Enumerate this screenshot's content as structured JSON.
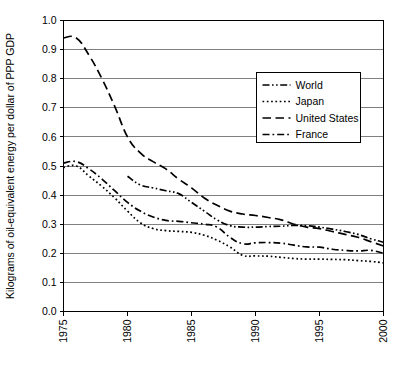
{
  "chart_data": {
    "type": "line",
    "title": "",
    "subtitle": "",
    "xlabel": "",
    "ylabel": "Kilograms of oil-equivalent energy per dollar of PPP GDP",
    "xlim": [
      1975,
      2000
    ],
    "ylim": [
      0.0,
      1.0
    ],
    "grid": true,
    "grid_axis": "y",
    "legend_position": "upper-right-inside",
    "x_tick_labels": [
      "1975",
      "1980",
      "1985",
      "1990",
      "1995",
      "2000"
    ],
    "x_ticks": [
      1975,
      1980,
      1985,
      1990,
      1995,
      2000
    ],
    "y_tick_labels": [
      "0.0",
      "0.1",
      "0.2",
      "0.3",
      "0.4",
      "0.5",
      "0.6",
      "0.7",
      "0.8",
      "0.9",
      "1.0"
    ],
    "y_ticks": [
      0.0,
      0.1,
      0.2,
      0.3,
      0.4,
      0.5,
      0.6,
      0.7,
      0.8,
      0.9,
      1.0
    ],
    "x": [
      1975,
      1976,
      1977,
      1978,
      1979,
      1980,
      1981,
      1982,
      1983,
      1984,
      1985,
      1986,
      1987,
      1988,
      1989,
      1990,
      1991,
      1992,
      1993,
      1994,
      1995,
      1996,
      1997,
      1998,
      1999,
      2000
    ],
    "series": [
      {
        "name": "World",
        "dash": "dash-dot-dot",
        "color": "#000000",
        "x": [
          1980,
          1981,
          1982,
          1983,
          1984,
          1985,
          1986,
          1987,
          1988,
          1989,
          1990,
          1991,
          1992,
          1993,
          1994,
          1995,
          1996,
          1997,
          1998,
          1999,
          2000
        ],
        "values": [
          0.465,
          0.435,
          0.425,
          0.415,
          0.405,
          0.375,
          0.345,
          0.315,
          0.295,
          0.29,
          0.29,
          0.292,
          0.293,
          0.296,
          0.295,
          0.29,
          0.283,
          0.275,
          0.265,
          0.25,
          0.238
        ]
      },
      {
        "name": "Japan",
        "dash": "dotted",
        "color": "#000000",
        "x": [
          1975,
          1976,
          1977,
          1978,
          1979,
          1980,
          1981,
          1982,
          1983,
          1984,
          1985,
          1986,
          1987,
          1988,
          1989,
          1990,
          1991,
          1992,
          1993,
          1994,
          1995,
          1996,
          1997,
          1998,
          1999,
          2000
        ],
        "values": [
          0.495,
          0.5,
          0.465,
          0.43,
          0.39,
          0.345,
          0.305,
          0.285,
          0.278,
          0.275,
          0.272,
          0.262,
          0.245,
          0.222,
          0.193,
          0.191,
          0.19,
          0.186,
          0.182,
          0.18,
          0.18,
          0.179,
          0.178,
          0.175,
          0.172,
          0.167
        ]
      },
      {
        "name": "United States",
        "dash": "long-dash",
        "color": "#000000",
        "x": [
          1975,
          1976,
          1977,
          1978,
          1979,
          1980,
          1981,
          1982,
          1983,
          1984,
          1985,
          1986,
          1987,
          1988,
          1989,
          1990,
          1991,
          1992,
          1993,
          1994,
          1995,
          1996,
          1997,
          1998,
          1999,
          2000
        ],
        "values": [
          0.94,
          0.94,
          0.88,
          0.8,
          0.705,
          0.6,
          0.545,
          0.515,
          0.49,
          0.455,
          0.425,
          0.39,
          0.365,
          0.345,
          0.335,
          0.33,
          0.323,
          0.315,
          0.3,
          0.29,
          0.285,
          0.275,
          0.265,
          0.255,
          0.24,
          0.225
        ]
      },
      {
        "name": "France",
        "dash": "dash-dot",
        "color": "#000000",
        "x": [
          1975,
          1976,
          1977,
          1978,
          1979,
          1980,
          1981,
          1982,
          1983,
          1984,
          1985,
          1986,
          1987,
          1988,
          1989,
          1990,
          1991,
          1992,
          1993,
          1994,
          1995,
          1996,
          1997,
          1998,
          1999,
          2000
        ],
        "values": [
          0.51,
          0.515,
          0.49,
          0.455,
          0.415,
          0.375,
          0.345,
          0.325,
          0.313,
          0.31,
          0.305,
          0.3,
          0.29,
          0.255,
          0.233,
          0.236,
          0.237,
          0.235,
          0.228,
          0.222,
          0.221,
          0.214,
          0.21,
          0.208,
          0.21,
          0.2
        ]
      }
    ]
  },
  "legend": {
    "entries": [
      {
        "label": "World"
      },
      {
        "label": "Japan"
      },
      {
        "label": "United States"
      },
      {
        "label": "France"
      }
    ]
  }
}
